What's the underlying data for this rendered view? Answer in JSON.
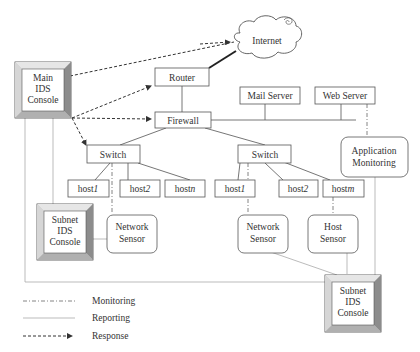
{
  "nodes": {
    "internet": {
      "label": "Internet"
    },
    "router": {
      "label": "Router"
    },
    "firewall": {
      "label": "Firewall"
    },
    "mail_server": {
      "label": "Mail Server"
    },
    "web_server": {
      "label": "Web Server"
    },
    "app_monitoring": {
      "line1": "Application",
      "line2": "Monitoring"
    },
    "main_console": {
      "line1": "Main",
      "line2": "IDS",
      "line3": "Console"
    },
    "switch_left": {
      "label": "Switch"
    },
    "switch_right": {
      "label": "Switch"
    },
    "left_host1": {
      "label": "host",
      "suffix": "1"
    },
    "left_host2": {
      "label": "host",
      "suffix": "2"
    },
    "left_hostn": {
      "label": "host",
      "suffix": "n"
    },
    "right_host1": {
      "label": "host",
      "suffix": "1"
    },
    "right_host2": {
      "label": "host",
      "suffix": "2"
    },
    "right_hostm": {
      "label": "host",
      "suffix": "m"
    },
    "left_network_sensor": {
      "line1": "Network",
      "line2": "Sensor"
    },
    "right_network_sensor": {
      "line1": "Network",
      "line2": "Sensor"
    },
    "host_sensor": {
      "line1": "Host",
      "line2": "Sensor"
    },
    "left_subnet_console": {
      "line1": "Subnet",
      "line2": "IDS",
      "line3": "Console"
    },
    "right_subnet_console": {
      "line1": "Subnet",
      "line2": "IDS",
      "line3": "Console"
    }
  },
  "legend": {
    "monitoring": "Monitoring",
    "reporting": "Reporting",
    "response": "Response"
  },
  "colors": {
    "line": "#555555",
    "light_line": "#999999",
    "box_border": "#555555",
    "bevel_light": "#d8d8d8",
    "bevel_dark": "#8a8a8a"
  }
}
